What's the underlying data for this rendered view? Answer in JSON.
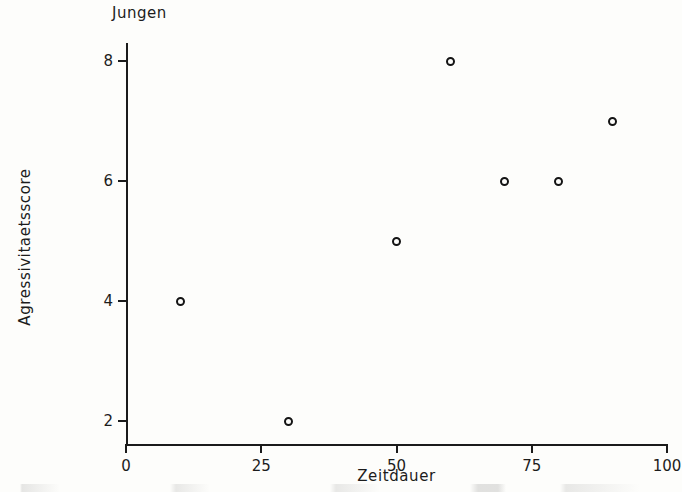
{
  "figure": {
    "title": "Jungen",
    "xlabel": "Zeitdauer",
    "ylabel": "Agressivitaetsscore",
    "marker_color": "#141414",
    "axis_color": "#1b1b1b",
    "background_color": "#fdfdfb"
  },
  "chart_data": {
    "type": "scatter",
    "title": "Jungen",
    "xlabel": "Zeitdauer",
    "ylabel": "Agressivitaetsscore",
    "xlim": [
      0,
      100
    ],
    "ylim": [
      1.6,
      8.3
    ],
    "xticks": [
      0,
      25,
      50,
      75,
      100
    ],
    "yticks": [
      2,
      4,
      6,
      8
    ],
    "xtick_labels": [
      "0",
      "25",
      "50",
      "75",
      "100"
    ],
    "ytick_labels": [
      "2",
      "4",
      "6",
      "8"
    ],
    "grid": false,
    "legend": false,
    "series": [
      {
        "name": "Jungen",
        "marker": "open-circle",
        "points": [
          {
            "x": 10,
            "y": 4
          },
          {
            "x": 30,
            "y": 2
          },
          {
            "x": 50,
            "y": 5
          },
          {
            "x": 60,
            "y": 8
          },
          {
            "x": 70,
            "y": 6
          },
          {
            "x": 80,
            "y": 6
          },
          {
            "x": 90,
            "y": 7
          }
        ]
      }
    ]
  }
}
